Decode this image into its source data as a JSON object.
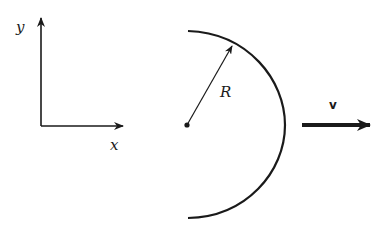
{
  "diagram": {
    "type": "physics-figure",
    "axes": {
      "x_label": "x",
      "y_label": "y"
    },
    "shell": {
      "shape": "hemispherical-shell",
      "radius_label": "R"
    },
    "velocity": {
      "label": "v",
      "direction": "positive x"
    },
    "colors": {
      "ink": "#1a1a1a",
      "background": "#ffffff"
    }
  }
}
